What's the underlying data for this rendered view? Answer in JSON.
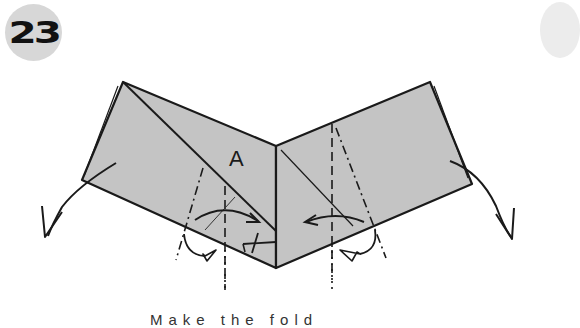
{
  "step": {
    "number": "23"
  },
  "diagram": {
    "point_label": "A",
    "fill_color": "#c4c4c4",
    "line_color": "#1a1a1a",
    "badge_color": "#d7d7d7",
    "left_flap": {
      "fold_type": "mountain-and-valley",
      "arrow": "rotate-down-left"
    },
    "right_flap": {
      "fold_type": "mountain-and-valley",
      "arrow": "rotate-down-right"
    }
  },
  "caption": {
    "text": "Make the fold"
  }
}
